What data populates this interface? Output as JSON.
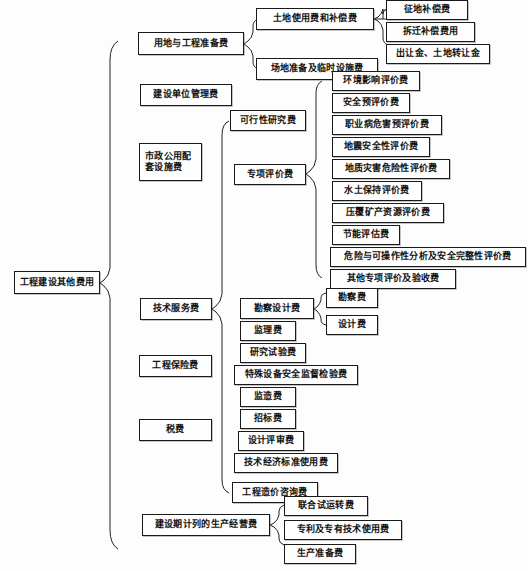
{
  "diagram": {
    "title": "工程建设其他费用",
    "type": "tree",
    "root": {
      "label": "工程建设其他费用"
    },
    "level1": [
      {
        "label": "用地与工程准备费"
      },
      {
        "label": "建设单位管理费"
      },
      {
        "label": "市政公用配套设施费"
      },
      {
        "label": "技术服务费"
      },
      {
        "label": "工程保险费"
      },
      {
        "label": "税费"
      },
      {
        "label": "建设期计列的生产经营费"
      }
    ],
    "land_prep_children": [
      {
        "label": "土地使用费和补偿费"
      },
      {
        "label": "场地准备及临时设施费"
      }
    ],
    "land_use_children": [
      {
        "label": "征地补偿费"
      },
      {
        "label": "拆迁补偿费用"
      },
      {
        "label": "出让金、土地转让金"
      }
    ],
    "tech_service_children": [
      {
        "label": "可行性研究费"
      },
      {
        "label": "专项评价费"
      },
      {
        "label": "勘察设计费"
      },
      {
        "label": "监理费"
      },
      {
        "label": "研究试验费"
      },
      {
        "label": "特殊设备安全监督检验费"
      },
      {
        "label": "监造费"
      },
      {
        "label": "招标费"
      },
      {
        "label": "设计评审费"
      },
      {
        "label": "技术经济标准使用费"
      },
      {
        "label": "工程造价咨询费"
      }
    ],
    "special_eval_children": [
      {
        "label": "环境影响评价费"
      },
      {
        "label": "安全预评价费"
      },
      {
        "label": "职业病危害预评价费"
      },
      {
        "label": "地震安全性评价费"
      },
      {
        "label": "地质灾害危险性评价费"
      },
      {
        "label": "水土保持评价费"
      },
      {
        "label": "压覆矿产资源评价费"
      },
      {
        "label": "节能评估费"
      },
      {
        "label": "危险与可操作性分析及安全完整性评价费"
      },
      {
        "label": "其他专项评价及验收费"
      }
    ],
    "survey_design_children": [
      {
        "label": "勘察费"
      },
      {
        "label": "设计费"
      }
    ],
    "production_children": [
      {
        "label": "联合试运转费"
      },
      {
        "label": "专利及专有技术使用费"
      },
      {
        "label": "生产准备费"
      }
    ],
    "colors": {
      "background": "#fdfdfd",
      "box_border": "#1a1a1a",
      "box_fill": "#fefefe",
      "link_stroke": "#222222",
      "text": "#111111"
    }
  }
}
